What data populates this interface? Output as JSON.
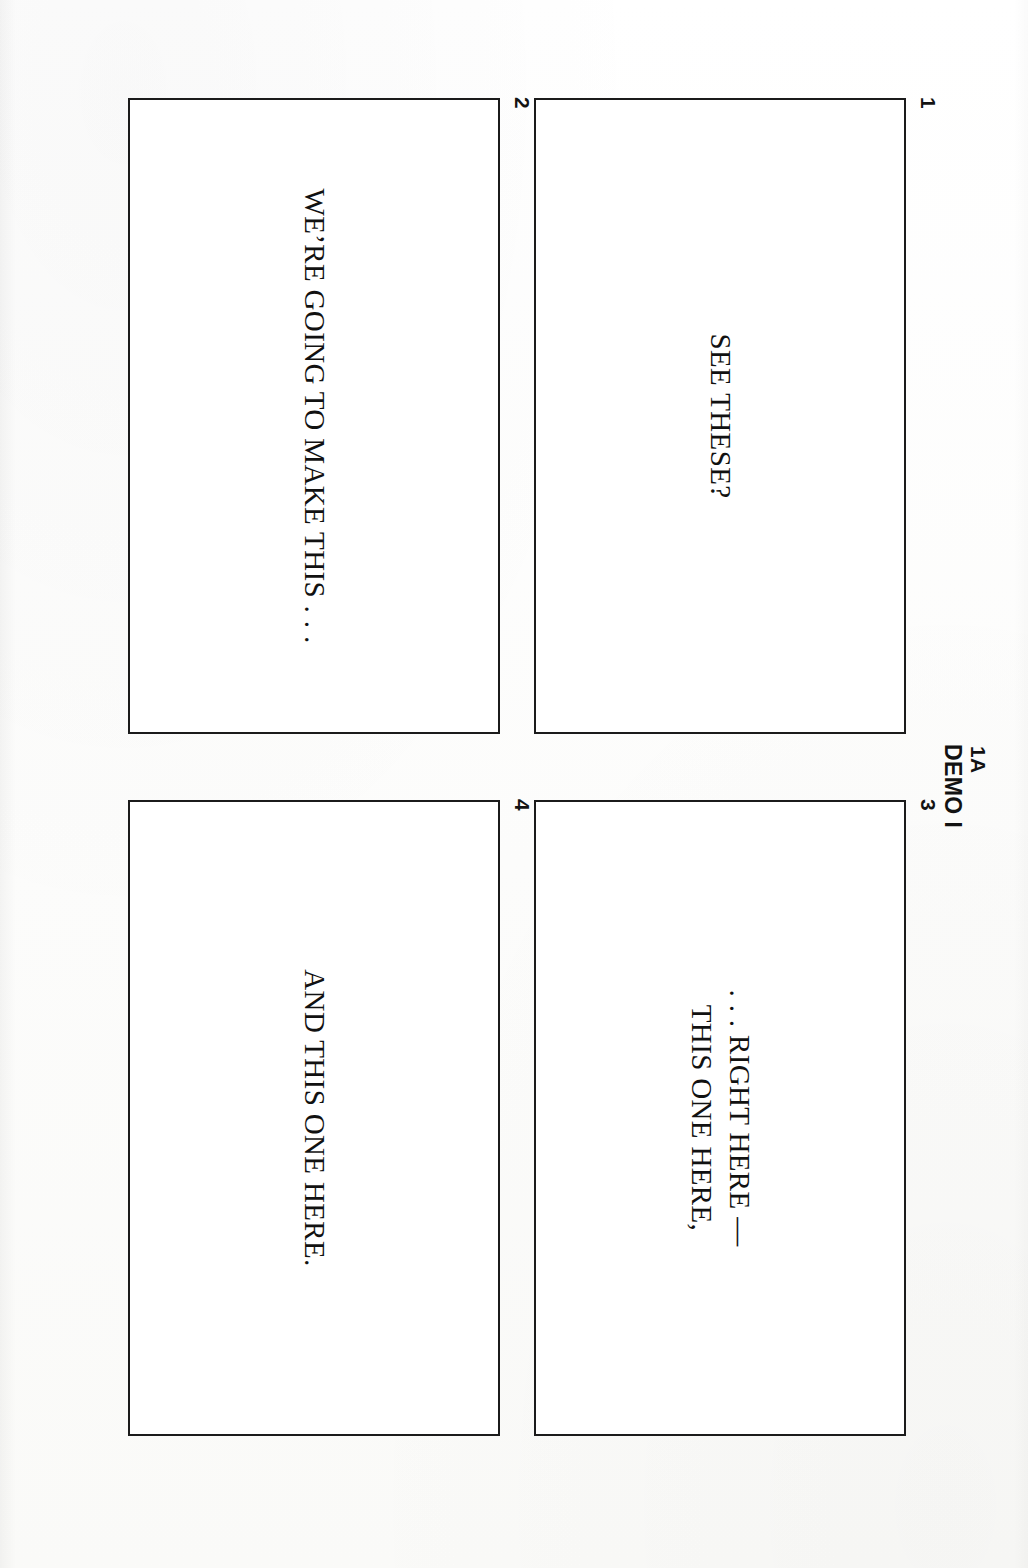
{
  "page": {
    "code": "1A",
    "title": "DEMO I",
    "background_color": "#fdfdfc",
    "ink_color": "#111111"
  },
  "panels": [
    {
      "number": "1",
      "caption": "SEE THESE?"
    },
    {
      "number": "2",
      "caption": "WE’RE GOING TO MAKE THIS . . ."
    },
    {
      "number": "3",
      "caption": ". . . RIGHT HERE —\nTHIS ONE HERE,"
    },
    {
      "number": "4",
      "caption": "AND THIS ONE HERE."
    }
  ]
}
